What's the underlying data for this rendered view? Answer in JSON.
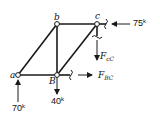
{
  "diagram": {
    "type": "truss-free-body",
    "nodes": {
      "a": "a",
      "b": "b",
      "c": "c",
      "B": "B"
    },
    "loads": {
      "c_horizontal": {
        "value": "75",
        "unit": "k"
      },
      "a_reaction": {
        "value": "70",
        "unit": "k"
      },
      "B_vertical": {
        "value": "40",
        "unit": "k"
      }
    },
    "member_forces": {
      "cC": {
        "symbol": "F",
        "subscript": "cC"
      },
      "BC": {
        "symbol": "F",
        "subscript": "BC"
      }
    },
    "colors": {
      "line": "#1a1a1a",
      "background": "#ffffff"
    }
  }
}
